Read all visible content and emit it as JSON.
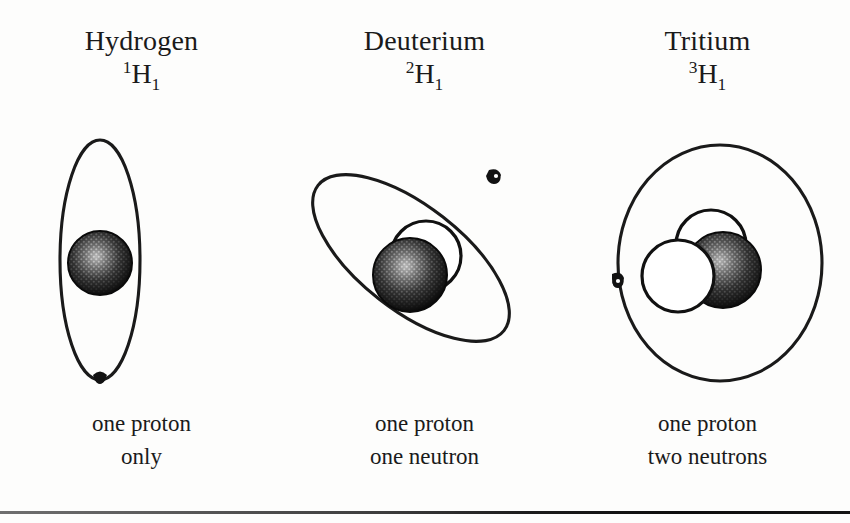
{
  "figure": {
    "background_color": "#fdfdfc",
    "ink_color": "#1a1a1a"
  },
  "columns": [
    {
      "id": "hydrogen",
      "name": "Hydrogen",
      "symbol_mass_number": "1",
      "symbol_element": "H",
      "symbol_atomic_number": "1",
      "caption_line_1": "one proton",
      "caption_line_2": "only",
      "nucleus": {
        "protons": 1,
        "neutrons": 0
      },
      "orbit": {
        "shape": "ellipse",
        "orientation_deg": 0,
        "rx": 40,
        "ry": 120,
        "description": "tall narrow vertical ellipse"
      },
      "electrons": 1,
      "electron_position": "bottom of orbit"
    },
    {
      "id": "deuterium",
      "name": "Deuterium",
      "symbol_mass_number": "2",
      "symbol_element": "H",
      "symbol_atomic_number": "1",
      "caption_line_1": "one proton",
      "caption_line_2": "one neutron",
      "nucleus": {
        "protons": 1,
        "neutrons": 1
      },
      "orbit": {
        "shape": "ellipse",
        "orientation_deg": -52,
        "rx": 52,
        "ry": 118,
        "description": "tilted ellipse leaning right"
      },
      "electrons": 1,
      "electron_position": "upper right of orbit"
    },
    {
      "id": "tritium",
      "name": "Tritium",
      "symbol_mass_number": "3",
      "symbol_element": "H",
      "symbol_atomic_number": "1",
      "caption_line_1": "one proton",
      "caption_line_2": "two neutrons",
      "nucleus": {
        "protons": 1,
        "neutrons": 2
      },
      "orbit": {
        "shape": "ellipse",
        "orientation_deg": 0,
        "rx": 102,
        "ry": 118,
        "description": "large rounded near-circular orbit"
      },
      "electrons": 1,
      "electron_position": "left edge of orbit"
    }
  ],
  "legend": {
    "proton_style": "dark stippled sphere",
    "neutron_style": "white outlined sphere",
    "electron_style": "small solid dot on orbit"
  }
}
